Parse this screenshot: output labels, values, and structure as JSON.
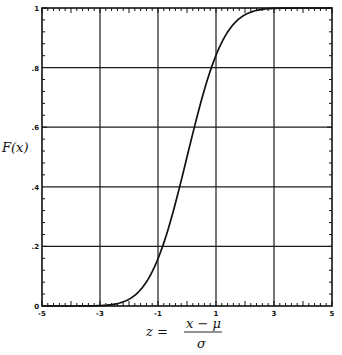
{
  "chart_data": {
    "type": "line",
    "title": "",
    "xlabel": "z = (x − μ) / σ",
    "ylabel": "F(x)",
    "xlim": [
      -5,
      5
    ],
    "ylim": [
      0,
      1
    ],
    "grid": true,
    "legend": null,
    "x_ticks": [
      -5,
      -3,
      -1,
      1,
      3,
      5
    ],
    "x_tick_labels": [
      "-5",
      "-3",
      "-1",
      "1",
      "3",
      "5"
    ],
    "y_ticks": [
      0,
      0.2,
      0.4,
      0.6,
      0.8,
      1
    ],
    "y_tick_labels": [
      "0",
      ".2",
      ".4",
      ".6",
      ".8",
      "1"
    ],
    "series": [
      {
        "name": "Standard normal CDF",
        "x": [
          -5,
          -4.5,
          -4,
          -3.5,
          -3,
          -2.5,
          -2,
          -1.5,
          -1,
          -0.5,
          0,
          0.5,
          1,
          1.5,
          2,
          2.5,
          3,
          3.5,
          4,
          4.5,
          5
        ],
        "values": [
          0.0,
          0.0,
          0.0,
          0.0002,
          0.0013,
          0.0062,
          0.0228,
          0.0668,
          0.1587,
          0.3085,
          0.5,
          0.6915,
          0.8413,
          0.9332,
          0.9772,
          0.9938,
          0.9987,
          0.9998,
          1.0,
          1.0,
          1.0
        ]
      }
    ]
  },
  "labels": {
    "ylabel": "F(x)",
    "xlabel_lhs": "z =",
    "xlabel_num": "x − μ",
    "xlabel_den": "σ"
  },
  "colors": {
    "line": "#111111",
    "grid": "#1a1a1a",
    "background": "#ffffff"
  }
}
